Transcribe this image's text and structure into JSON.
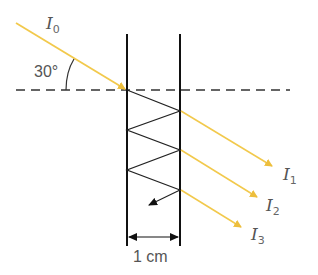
{
  "diagram": {
    "incident_label": "I",
    "incident_sub": "0",
    "angle_label": "30°",
    "width_label": "1 cm",
    "transmitted": [
      {
        "label": "I",
        "sub": "1"
      },
      {
        "label": "I",
        "sub": "2"
      },
      {
        "label": "I",
        "sub": "3"
      }
    ],
    "colors": {
      "ray": "#F2C94C",
      "plate": "#111111",
      "zigzag": "#222222",
      "dashed": "#333333",
      "text": "#555555"
    }
  }
}
